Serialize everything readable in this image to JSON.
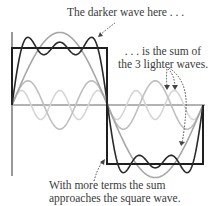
{
  "annotations": {
    "darker_wave": "The darker wave here . . .",
    "sum_line1": ". . . is the sum of",
    "sum_line2": "the 3 lighter waves.",
    "more_terms_line1": "With more terms the sum",
    "more_terms_line2": "approaches the square wave."
  },
  "figure": {
    "type": "fourier-series-square-wave",
    "components": [
      {
        "name": "fundamental",
        "harmonic": 1,
        "amplitude_ratio": "4/π",
        "color": "#a8a8a8"
      },
      {
        "name": "third-harmonic",
        "harmonic": 3,
        "amplitude_ratio": "4/(3π)",
        "color": "#bdbdbd"
      },
      {
        "name": "fifth-harmonic",
        "harmonic": 5,
        "amplitude_ratio": "4/(5π)",
        "color": "#d4d4d4"
      }
    ],
    "sum_wave": {
      "name": "partial-sum",
      "terms": 3,
      "color": "#2b2b2b"
    },
    "target_wave": {
      "name": "square-wave",
      "color": "#1a1a1a"
    }
  }
}
